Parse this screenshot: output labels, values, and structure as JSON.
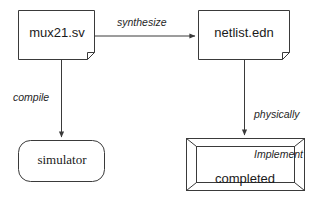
{
  "diagram": {
    "background_color": "#ffffff",
    "stroke_color": "#3a3a3a",
    "text_color": "#1a1a1a",
    "nodes": {
      "source_file": {
        "label": "mux21.sv",
        "shape": "document"
      },
      "netlist_file": {
        "label": "netlist.edn",
        "shape": "document"
      },
      "simulator": {
        "label": "simulator",
        "shape": "rounded-rectangle"
      },
      "completed_circuit": {
        "label_line1": "completed",
        "label_line2": "circuit",
        "shape": "beveled-frame"
      }
    },
    "edges": {
      "synthesize": {
        "label": "synthesize",
        "from": "mux21.sv",
        "to": "netlist.edn",
        "direction": "right"
      },
      "compile": {
        "label": "compile",
        "from": "mux21.sv",
        "to": "simulator",
        "direction": "down"
      },
      "implement": {
        "label_line1": "physically",
        "label_line2": "Implement",
        "from": "netlist.edn",
        "to": "completed circuit",
        "direction": "down"
      }
    }
  }
}
